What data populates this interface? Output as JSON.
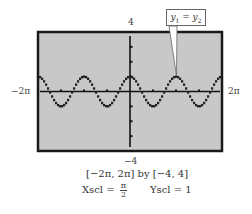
{
  "chart_data": {
    "type": "line",
    "title": "",
    "function_hint": "y = cos(2x)",
    "x_window": [
      "-2π",
      "2π"
    ],
    "y_window": [
      -4,
      4
    ],
    "xlim": [
      -6.2832,
      6.2832
    ],
    "ylim": [
      -4,
      4
    ],
    "xscl": "π/2",
    "yscl": 1,
    "grid": false,
    "series": [
      {
        "name": "y1 = y2 graph",
        "style": "dotted-thick",
        "x": [
          -6.2832,
          -5.4978,
          -4.7124,
          -3.927,
          -3.1416,
          -2.3562,
          -1.5708,
          -0.7854,
          0,
          0.7854,
          1.5708,
          2.3562,
          3.1416,
          3.927,
          4.7124,
          5.4978,
          6.2832
        ],
        "values": [
          1,
          0,
          -1,
          0,
          1,
          0,
          -1,
          0,
          1,
          0,
          -1,
          0,
          1,
          0,
          -1,
          0,
          1
        ]
      }
    ],
    "annotations": [
      {
        "text": "y1 = y2",
        "points_to": {
          "x": 3.1416,
          "y": 1
        }
      }
    ],
    "xlabel": "",
    "ylabel": ""
  },
  "labels": {
    "y_max": "4",
    "y_min": "−4",
    "x_min": "−2π",
    "x_max": "2π",
    "callout_main": "y",
    "callout_sub1": "1",
    "callout_eq": " = y",
    "callout_sub2": "2"
  },
  "caption": {
    "window": "[−2π, 2π]  by  [−4, 4]",
    "xscl_label": "Xscl = ",
    "xscl_num": "π",
    "xscl_den": "2",
    "yscl": "Yscl = 1"
  },
  "colors": {
    "screen_bg": "#c8c8c8",
    "frame": "#1a1a1a",
    "axis": "#111111",
    "curve": "#222222"
  }
}
